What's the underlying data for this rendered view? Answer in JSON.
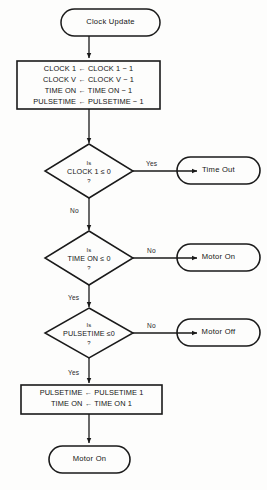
{
  "diagram": {
    "background_color": "#fdfdfc",
    "stroke_color": "#1a1a1a",
    "text_color": "#141414"
  },
  "nodes": {
    "start_terminal": {
      "type": "terminal",
      "label": "Clock Update"
    },
    "decrement_process": {
      "type": "process",
      "lines": [
        "CLOCK 1 ← CLOCK 1 − 1",
        "CLOCK V ← CLOCK V − 1",
        "TIME ON ← TIME ON − 1",
        "PULSETIME ← PULSETIME − 1"
      ]
    },
    "decision_clock1": {
      "type": "decision",
      "line1": "Is",
      "line2": "CLOCK 1 ≤ 0",
      "line3": "?",
      "yes_label": "Yes",
      "no_label": "No"
    },
    "terminal_time_out": {
      "type": "terminal",
      "label": "Time Out"
    },
    "decision_time_on": {
      "type": "decision",
      "line1": "Is",
      "line2": "TIME ON ≤ 0",
      "line3": "?",
      "yes_label": "Yes",
      "no_label": "No"
    },
    "terminal_motor_on_upper": {
      "type": "terminal",
      "label": "Motor On"
    },
    "decision_pulsetime": {
      "type": "decision",
      "line1": "Is",
      "line2": "PULSETIME ≤0",
      "line3": "?",
      "yes_label": "Yes",
      "no_label": "No"
    },
    "terminal_motor_off": {
      "type": "terminal",
      "label": "Motor Off"
    },
    "reset_process": {
      "type": "process",
      "lines": [
        "PULSETIME ← PULSETIME 1",
        "TIME ON ← TIME ON 1"
      ]
    },
    "terminal_motor_on_lower": {
      "type": "terminal",
      "label": "Motor On"
    }
  }
}
